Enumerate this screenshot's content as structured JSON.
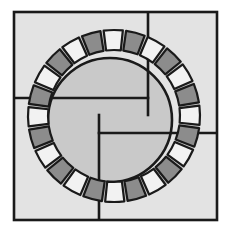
{
  "figure": {
    "title": "Circular paving pattern in a square frame",
    "canvas": {
      "width": 229,
      "height": 234
    },
    "background_color": "#ffffff"
  },
  "colors": {
    "outline": "#1a1a1a",
    "background": "#ffffff",
    "field": "#e3e3e3",
    "disc": "#c9c9c9",
    "segment_dark": "#8c8c8c",
    "segment_light": "#f2f2f2",
    "ring_gap": "#c9c9c9"
  },
  "frame": {
    "x": 14,
    "y": 12,
    "width": 203,
    "height": 208,
    "stroke_width": 2.6
  },
  "pinwheel": {
    "center_x": 99,
    "center_y": 115,
    "stroke_width": 2.6,
    "lines": [
      {
        "name": "pinwheel-line-top",
        "x1": 148,
        "y1": 12,
        "x2": 148,
        "y2": 115
      },
      {
        "name": "pinwheel-line-right",
        "x1": 217,
        "y1": 133,
        "x2": 99,
        "y2": 133
      },
      {
        "name": "pinwheel-line-bottom",
        "x1": 99,
        "y1": 220,
        "x2": 99,
        "y2": 115
      },
      {
        "name": "pinwheel-line-left",
        "x1": 14,
        "y1": 98,
        "x2": 148,
        "y2": 98
      }
    ]
  },
  "inner_disc": {
    "center_x": 110,
    "center_y": 120,
    "radius": 62,
    "fill": "#c9c9c9",
    "stroke_width": 2.6
  },
  "ring": {
    "center_x": 114,
    "center_y": 116,
    "inner_radius": 66,
    "outer_radius": 86,
    "rotation_deg": -8,
    "segment_count": 24,
    "gap_deg": 2.2,
    "stroke_width": 2.2,
    "segments": [
      {
        "index": 0,
        "shade": "light"
      },
      {
        "index": 1,
        "shade": "dark"
      },
      {
        "index": 2,
        "shade": "light"
      },
      {
        "index": 3,
        "shade": "dark"
      },
      {
        "index": 4,
        "shade": "light"
      },
      {
        "index": 5,
        "shade": "dark"
      },
      {
        "index": 6,
        "shade": "light"
      },
      {
        "index": 7,
        "shade": "dark"
      },
      {
        "index": 8,
        "shade": "light"
      },
      {
        "index": 9,
        "shade": "dark"
      },
      {
        "index": 10,
        "shade": "light"
      },
      {
        "index": 11,
        "shade": "dark"
      },
      {
        "index": 12,
        "shade": "light"
      },
      {
        "index": 13,
        "shade": "dark"
      },
      {
        "index": 14,
        "shade": "light"
      },
      {
        "index": 15,
        "shade": "dark"
      },
      {
        "index": 16,
        "shade": "light"
      },
      {
        "index": 17,
        "shade": "dark"
      },
      {
        "index": 18,
        "shade": "light"
      },
      {
        "index": 19,
        "shade": "dark"
      },
      {
        "index": 20,
        "shade": "light"
      },
      {
        "index": 21,
        "shade": "dark"
      },
      {
        "index": 22,
        "shade": "light"
      },
      {
        "index": 23,
        "shade": "dark"
      }
    ]
  }
}
